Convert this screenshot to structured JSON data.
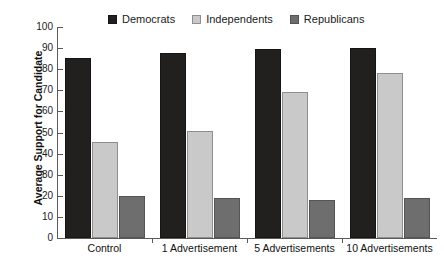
{
  "chart_data": {
    "type": "bar",
    "title": "",
    "subtitle": "",
    "xlabel": "",
    "ylabel": "Average Support for Candidate",
    "categories": [
      "Control",
      "1 Advertisement",
      "5 Advertisements",
      "10 Advertisements"
    ],
    "series": [
      {
        "name": "Democrats",
        "color": "#221f1f",
        "values": [
          85.5,
          87.5,
          89.5,
          90.0
        ]
      },
      {
        "name": "Independents",
        "color": "#c9c9c9",
        "values": [
          45.5,
          50.5,
          69.0,
          78.0
        ]
      },
      {
        "name": "Republicans",
        "color": "#6e6e6e",
        "values": [
          20.0,
          19.0,
          18.0,
          19.0
        ]
      }
    ],
    "ylim": [
      0,
      100
    ],
    "ytick_labels": [
      "0",
      "10",
      "20",
      "30",
      "40",
      "50",
      "60",
      "70",
      "80",
      "90",
      "100"
    ],
    "ytick_values": [
      0,
      10,
      20,
      30,
      40,
      50,
      60,
      70,
      80,
      90,
      100
    ],
    "grid": false,
    "legend_position": "top-center"
  },
  "legend": {
    "entries": [
      {
        "label": "Democrats"
      },
      {
        "label": "Independents"
      },
      {
        "label": "Republicans"
      }
    ]
  },
  "axes": {
    "y_title": "Average Support for Candidate"
  }
}
